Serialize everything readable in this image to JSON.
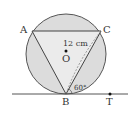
{
  "diagram": {
    "type": "geometry",
    "points": {
      "A": {
        "label": "A",
        "x": 32,
        "y": 31
      },
      "B": {
        "label": "B",
        "x": 66,
        "y": 94
      },
      "C": {
        "label": "C",
        "x": 101,
        "y": 31
      },
      "O": {
        "label": "O",
        "x": 66,
        "y": 51
      },
      "T": {
        "label": "T",
        "x": 110,
        "y": 94
      }
    },
    "circle": {
      "cx": 66,
      "cy": 55,
      "r": 40,
      "fill": "#dcdcdc",
      "stroke": "#555555"
    },
    "annotations": {
      "radius_label": "12 cm",
      "angle_label": "60°"
    },
    "colors": {
      "fill": "#dcdcdc",
      "stroke": "#555555",
      "text": "#333333"
    }
  }
}
